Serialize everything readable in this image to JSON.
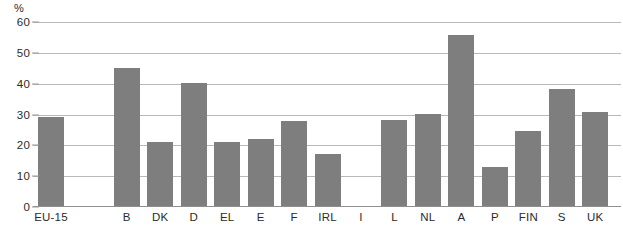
{
  "chart_data": {
    "type": "bar",
    "title": "",
    "xlabel": "",
    "ylabel": "%",
    "ylim": [
      0,
      60
    ],
    "yticks": [
      0,
      10,
      20,
      30,
      40,
      50,
      60
    ],
    "grid": true,
    "legend": "none",
    "bar_color": "#7e7e7e",
    "categories": [
      "EU-15",
      "B",
      "DK",
      "D",
      "EL",
      "E",
      "F",
      "IRL",
      "I",
      "L",
      "NL",
      "A",
      "P",
      "FIN",
      "S",
      "UK"
    ],
    "values": [
      28.8,
      44.7,
      20.7,
      40.0,
      20.7,
      21.6,
      27.7,
      17.0,
      null,
      27.8,
      30.0,
      55.6,
      12.5,
      24.2,
      37.8,
      30.5
    ]
  },
  "axis": {
    "unit_label": "%",
    "tick_labels": [
      "60",
      "50",
      "40",
      "30",
      "20",
      "10",
      "0"
    ]
  },
  "x_axis": {
    "labels": [
      "EU-15",
      "B",
      "DK",
      "D",
      "EL",
      "E",
      "F",
      "IRL",
      "I",
      "L",
      "NL",
      "A",
      "P",
      "FIN",
      "S",
      "UK"
    ]
  }
}
